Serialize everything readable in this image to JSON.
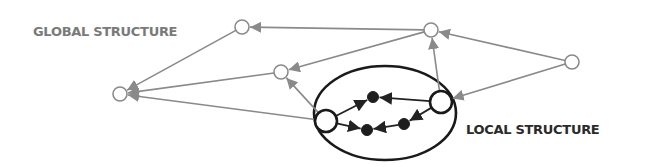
{
  "labels": {
    "global": "GLOBAL STRUCTURE",
    "local": "LOCAL STRUCTURE"
  },
  "colors": {
    "global_edge": "#8a8a8a",
    "local_edge": "#222222",
    "local_node_fill": "#1e1e1e",
    "ellipse": "#1a1a1a",
    "global_text": "#7a7a7a",
    "local_text": "#2a2a2a"
  },
  "nodes": [
    {
      "id": "g-left",
      "kind": "global"
    },
    {
      "id": "g-top-left",
      "kind": "global"
    },
    {
      "id": "g-top-right",
      "kind": "global"
    },
    {
      "id": "g-middle",
      "kind": "global"
    },
    {
      "id": "g-right",
      "kind": "global"
    },
    {
      "id": "l-big-left",
      "kind": "local-hub"
    },
    {
      "id": "l-big-right",
      "kind": "local-hub"
    },
    {
      "id": "l-dot-top",
      "kind": "local-inner"
    },
    {
      "id": "l-dot-bottom-left",
      "kind": "local-inner"
    },
    {
      "id": "l-dot-bottom-right",
      "kind": "local-inner"
    }
  ],
  "edges": [
    {
      "from": "g-top-right",
      "to": "g-top-left",
      "kind": "global"
    },
    {
      "from": "g-top-left",
      "to": "g-left",
      "kind": "global"
    },
    {
      "from": "g-top-right",
      "to": "g-middle",
      "kind": "global"
    },
    {
      "from": "g-middle",
      "to": "g-left",
      "kind": "global"
    },
    {
      "from": "l-big-left",
      "to": "g-left",
      "kind": "global"
    },
    {
      "from": "l-big-left",
      "to": "g-middle",
      "kind": "global"
    },
    {
      "from": "g-right",
      "to": "g-top-right",
      "kind": "global"
    },
    {
      "from": "l-big-right",
      "to": "g-top-right",
      "kind": "global"
    },
    {
      "from": "g-right",
      "to": "l-big-right",
      "kind": "global"
    },
    {
      "from": "l-big-left",
      "to": "l-dot-top",
      "kind": "local"
    },
    {
      "from": "l-big-right",
      "to": "l-dot-top",
      "kind": "local"
    },
    {
      "from": "l-big-left",
      "to": "l-dot-bottom-left",
      "kind": "local"
    },
    {
      "from": "l-dot-bottom-right",
      "to": "l-dot-bottom-left",
      "kind": "local"
    },
    {
      "from": "l-big-right",
      "to": "l-dot-bottom-right",
      "kind": "local"
    }
  ]
}
